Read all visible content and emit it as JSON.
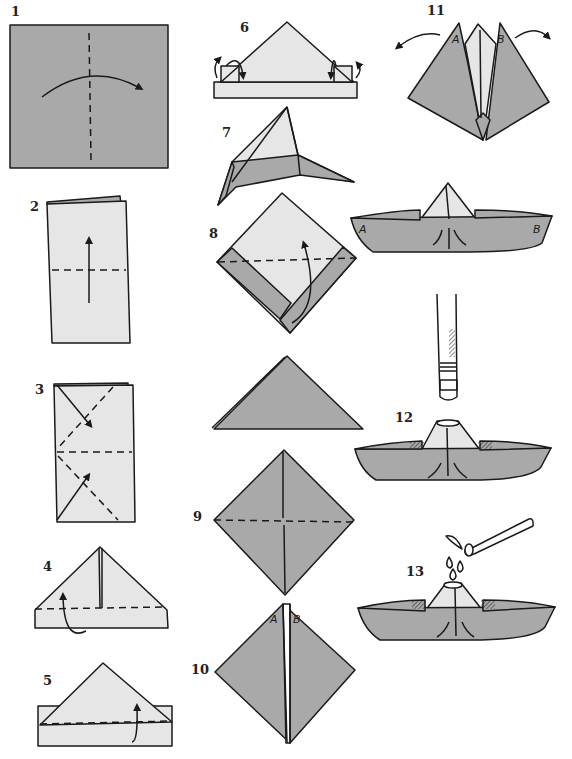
{
  "diagram": {
    "colors": {
      "paper_dark": "#a9a9a9",
      "paper_light": "#e6e6e6",
      "stroke": "#1a1a1a",
      "background": "#ffffff"
    },
    "steps": [
      {
        "number": "1",
        "label_x": 11,
        "label_y": 6,
        "description": "Square sheet, fold in half along vertical dashed line (arrow left to right)"
      },
      {
        "number": "2",
        "label_x": 30,
        "label_y": 199,
        "description": "Folded rectangle, fold bottom up along horizontal dashed line"
      },
      {
        "number": "3",
        "label_x": 35,
        "label_y": 382,
        "description": "Fold top corners diagonally down along dashed lines"
      },
      {
        "number": "4",
        "label_x": 43,
        "label_y": 559,
        "description": "Triangle with bottom strip, fold bottom edge up"
      },
      {
        "number": "5",
        "label_x": 43,
        "label_y": 673,
        "description": "Fold remaining bottom strip up on back side"
      },
      {
        "number": "6",
        "label_x": 240,
        "label_y": 20,
        "description": "Fold corners of bottom band around the back"
      },
      {
        "number": "7",
        "label_x": 222,
        "label_y": 125,
        "description": "Open hat shape from the bottom"
      },
      {
        "number": "8",
        "label_x": 209,
        "label_y": 226,
        "description": "Flatten into a square, fold bottom corner up along dashed line"
      },
      {
        "number": "9",
        "label_x": 193,
        "label_y": 509,
        "description": "Diamond shape, fold along horizontal dashed line"
      },
      {
        "number": "10",
        "label_x": 191,
        "label_y": 662,
        "description": "Diamond with flaps A and B at top"
      },
      {
        "number": "11",
        "label_x": 427,
        "label_y": 4,
        "description": "Pull flaps A and B apart outward"
      },
      {
        "number": "12",
        "label_x": 395,
        "label_y": 410,
        "description": "Finished boat; candle or stick placed over the peak"
      },
      {
        "number": "13",
        "label_x": 406,
        "label_y": 564,
        "description": "Drip candle wax onto the peak of the boat"
      }
    ],
    "flap_labels": {
      "step10_left": "A",
      "step10_right": "B",
      "step11_left": "A",
      "step11_right": "B",
      "boat_left": "A",
      "boat_right": "B"
    }
  }
}
